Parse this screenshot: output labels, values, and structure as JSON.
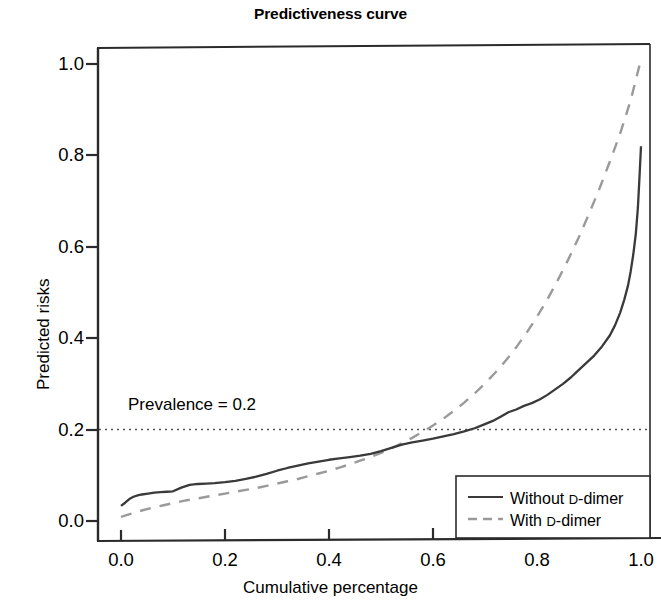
{
  "chart_data": {
    "type": "line",
    "title": "Predictiveness curve",
    "xlabel": "Cumulative percentage",
    "ylabel": "Predicted risks",
    "xlim": [
      0.0,
      1.0
    ],
    "ylim": [
      0.0,
      1.04
    ],
    "grid": false,
    "legend_position": "bottom-right",
    "xticks": [
      "0.0",
      "0.2",
      "0.4",
      "0.6",
      "0.8",
      "1.0"
    ],
    "xtick_values": [
      0.0,
      0.2,
      0.4,
      0.6,
      0.8,
      1.0
    ],
    "yticks": [
      "0.0",
      "0.2",
      "0.4",
      "0.6",
      "0.8",
      "1.0"
    ],
    "ytick_values": [
      0.0,
      0.2,
      0.4,
      0.6,
      0.8,
      1.0
    ],
    "annotations": [
      {
        "text": "Prevalence = 0.2",
        "x": 0.04,
        "y": 0.235,
        "reference_line_y": 0.2,
        "reference_line_style": "dotted"
      }
    ],
    "series": [
      {
        "name": "Without D-dimer",
        "style": "solid",
        "color": "#3a3a3a",
        "x": [
          0.0,
          0.008,
          0.016,
          0.024,
          0.032,
          0.04,
          0.052,
          0.064,
          0.076,
          0.088,
          0.1,
          0.116,
          0.132,
          0.148,
          0.164,
          0.18,
          0.2,
          0.22,
          0.24,
          0.26,
          0.28,
          0.3,
          0.32,
          0.34,
          0.36,
          0.38,
          0.4,
          0.42,
          0.44,
          0.46,
          0.48,
          0.5,
          0.52,
          0.54,
          0.56,
          0.58,
          0.6,
          0.62,
          0.64,
          0.66,
          0.68,
          0.7,
          0.715,
          0.73,
          0.745,
          0.76,
          0.775,
          0.79,
          0.805,
          0.82,
          0.835,
          0.85,
          0.865,
          0.88,
          0.895,
          0.91,
          0.925,
          0.94,
          0.95,
          0.96,
          0.968,
          0.975,
          0.98,
          0.985,
          0.99,
          0.994,
          0.997,
          1.0
        ],
        "y": [
          0.033,
          0.04,
          0.048,
          0.053,
          0.056,
          0.058,
          0.06,
          0.062,
          0.063,
          0.064,
          0.065,
          0.073,
          0.079,
          0.081,
          0.082,
          0.083,
          0.085,
          0.088,
          0.092,
          0.097,
          0.103,
          0.11,
          0.116,
          0.121,
          0.126,
          0.13,
          0.134,
          0.137,
          0.14,
          0.143,
          0.147,
          0.153,
          0.16,
          0.167,
          0.172,
          0.176,
          0.18,
          0.185,
          0.19,
          0.196,
          0.203,
          0.212,
          0.219,
          0.228,
          0.238,
          0.244,
          0.252,
          0.258,
          0.266,
          0.276,
          0.288,
          0.3,
          0.314,
          0.33,
          0.346,
          0.362,
          0.382,
          0.406,
          0.428,
          0.456,
          0.485,
          0.515,
          0.545,
          0.582,
          0.628,
          0.685,
          0.75,
          0.82
        ]
      },
      {
        "name": "With D-dimer",
        "style": "dashed",
        "color": "#9a9a9a",
        "x": [
          0.0,
          0.02,
          0.04,
          0.06,
          0.08,
          0.1,
          0.12,
          0.14,
          0.16,
          0.18,
          0.2,
          0.22,
          0.24,
          0.26,
          0.28,
          0.3,
          0.32,
          0.34,
          0.36,
          0.38,
          0.4,
          0.42,
          0.44,
          0.46,
          0.48,
          0.5,
          0.52,
          0.54,
          0.56,
          0.58,
          0.6,
          0.62,
          0.64,
          0.66,
          0.68,
          0.7,
          0.72,
          0.74,
          0.76,
          0.78,
          0.8,
          0.82,
          0.84,
          0.86,
          0.88,
          0.9,
          0.92,
          0.94,
          0.96,
          0.98,
          1.0
        ],
        "y": [
          0.009,
          0.016,
          0.023,
          0.029,
          0.034,
          0.039,
          0.044,
          0.048,
          0.052,
          0.056,
          0.06,
          0.064,
          0.068,
          0.072,
          0.077,
          0.082,
          0.087,
          0.092,
          0.098,
          0.104,
          0.11,
          0.117,
          0.124,
          0.132,
          0.14,
          0.149,
          0.159,
          0.17,
          0.182,
          0.195,
          0.209,
          0.224,
          0.241,
          0.259,
          0.279,
          0.301,
          0.325,
          0.351,
          0.38,
          0.412,
          0.447,
          0.485,
          0.527,
          0.572,
          0.62,
          0.672,
          0.727,
          0.786,
          0.848,
          0.92,
          1.01
        ]
      }
    ]
  },
  "legend": {
    "items": [
      {
        "label_main": "Without ",
        "label_cap": "D",
        "label_rest": "-dimer",
        "style": "solid"
      },
      {
        "label_main": "With ",
        "label_cap": "D",
        "label_rest": "-dimer",
        "style": "dashed"
      }
    ]
  },
  "colors": {
    "axis": "#2b2b2b",
    "solid_series": "#3a3a3a",
    "dashed_series": "#9a9a9a",
    "prevalence_line": "#555555",
    "text": "#000000",
    "background": "#ffffff"
  }
}
